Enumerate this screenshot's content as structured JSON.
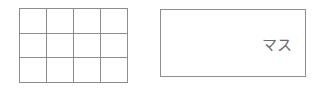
{
  "figure": {
    "background_color": "#ffffff",
    "line_color": "#8d8d8d",
    "text_color": "#6b6b6b"
  },
  "grid_figure": {
    "name": "grid",
    "columns": 4,
    "rows": 3,
    "cells": [
      {
        "id": "r1c1",
        "label": ""
      },
      {
        "id": "r1c2",
        "label": ""
      },
      {
        "id": "r1c3",
        "label": ""
      },
      {
        "id": "r1c4",
        "label": ""
      },
      {
        "id": "r2c1",
        "label": ""
      },
      {
        "id": "r2c2",
        "label": ""
      },
      {
        "id": "r2c3",
        "label": ""
      },
      {
        "id": "r2c4",
        "label": ""
      },
      {
        "id": "r3c1",
        "label": ""
      },
      {
        "id": "r3c2",
        "label": ""
      },
      {
        "id": "r3c3",
        "label": ""
      },
      {
        "id": "r3c4",
        "label": ""
      }
    ]
  },
  "rect_figure": {
    "name": "rectangle",
    "label": "マス"
  }
}
